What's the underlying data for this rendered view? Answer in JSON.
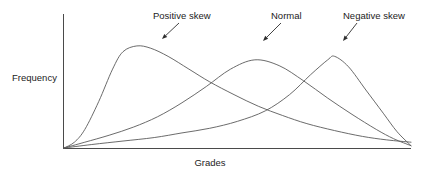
{
  "chart_data": {
    "type": "line",
    "title": "",
    "subtitle": "",
    "xlabel": "Grades",
    "ylabel": "Frequency",
    "xlim": [
      0,
      100
    ],
    "ylim": [
      0,
      100
    ],
    "grid": false,
    "axis_ticks": {
      "x": [],
      "y": []
    },
    "legend_position": "none",
    "series": [
      {
        "name": "Positive skew",
        "skew": "positive",
        "peak_x": 21,
        "peak_y": 88,
        "x": [
          0,
          3,
          6,
          10,
          14,
          17,
          21,
          25,
          30,
          36,
          42,
          49,
          56,
          63,
          70,
          78,
          86,
          93,
          100
        ],
        "values": [
          0,
          5,
          16,
          40,
          68,
          83,
          88,
          86,
          79,
          68,
          57,
          46,
          36,
          28,
          21,
          15,
          10,
          7,
          5
        ]
      },
      {
        "name": "Normal",
        "skew": "none",
        "peak_x": 55,
        "peak_y": 76,
        "x": [
          0,
          6,
          13,
          20,
          27,
          34,
          41,
          48,
          55,
          62,
          69,
          76,
          83,
          90,
          95,
          100
        ],
        "values": [
          0,
          5,
          11,
          18,
          27,
          39,
          53,
          68,
          76,
          71,
          58,
          43,
          29,
          16,
          8,
          2
        ]
      },
      {
        "name": "Negative skew",
        "skew": "negative",
        "peak_x": 78,
        "peak_y": 79,
        "x": [
          0,
          8,
          17,
          26,
          34,
          42,
          50,
          58,
          65,
          71,
          76,
          78,
          82,
          87,
          92,
          96,
          100
        ],
        "values": [
          0,
          3,
          6,
          9,
          13,
          17,
          23,
          32,
          46,
          63,
          76,
          79,
          70,
          50,
          30,
          14,
          2
        ]
      }
    ],
    "annotations": [
      {
        "label": "Positive skew",
        "label_x": 153,
        "label_y": 19,
        "arrow_from_x": 179,
        "arrow_from_y": 23,
        "arrow_to_x": 162,
        "arrow_to_y": 39
      },
      {
        "label": "Normal",
        "label_x": 271,
        "label_y": 19,
        "arrow_from_x": 281,
        "arrow_from_y": 23,
        "arrow_to_x": 263,
        "arrow_to_y": 41
      },
      {
        "label": "Negative skew",
        "label_x": 343,
        "label_y": 19,
        "arrow_from_x": 357,
        "arrow_from_y": 23,
        "arrow_to_x": 343,
        "arrow_to_y": 41
      }
    ]
  },
  "axes": {
    "y_label": "Frequency",
    "x_label": "Grades"
  },
  "annotations": {
    "positive": "Positive skew",
    "normal": "Normal",
    "negative": "Negative skew"
  },
  "colors": {
    "curve": "#5a5a5a",
    "axis": "#4a4a4a",
    "text": "#1c1c1c",
    "arrow": "#2e2e2e",
    "background": "#ffffff"
  }
}
